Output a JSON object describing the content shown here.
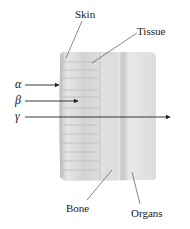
{
  "diagram": {
    "labels": {
      "skin": "Skin",
      "tissue": "Tissue",
      "bone": "Bone",
      "organs": "Organs"
    },
    "radiation": [
      {
        "symbol": "α",
        "name": "alpha",
        "stops_at": "skin"
      },
      {
        "symbol": "β",
        "name": "beta",
        "stops_at": "tissue"
      },
      {
        "symbol": "γ",
        "name": "gamma",
        "stops_at": "passes through"
      }
    ],
    "colors": {
      "block_light": "#ececec",
      "block_mid": "#d6d6d6",
      "block_dark": "#bdbdbd",
      "arrow": "#222222",
      "leader": "#555555"
    }
  }
}
